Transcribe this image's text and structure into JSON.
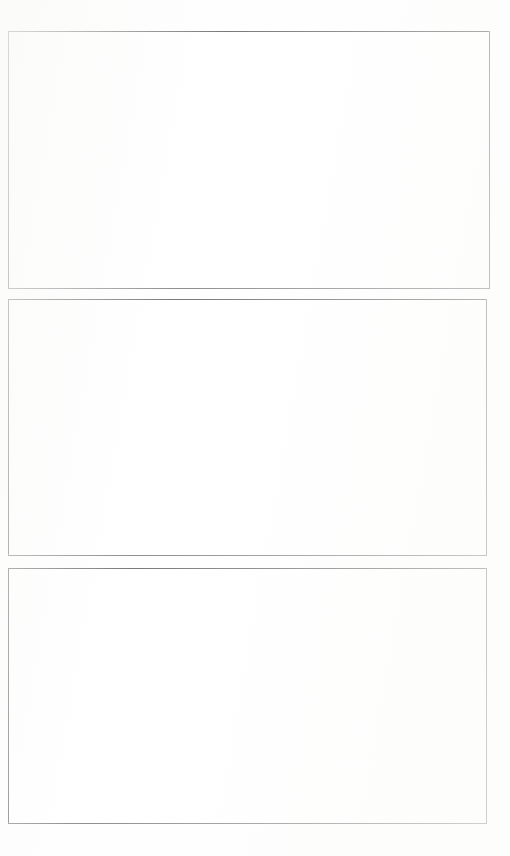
{
  "page": {
    "kind": "scanned-document-page",
    "width_px": 510,
    "height_px": 856,
    "background_color": "#fefefe",
    "content_text": "",
    "has_text": false,
    "has_caption": false,
    "frame_count": 3
  },
  "style": {
    "border_color": "#5e5e5e",
    "border_color_strong": "#3f3f3f",
    "frame_fill": "#ffffff",
    "border_width_px": 1
  },
  "frames": [
    {
      "id": "figure-frame-1",
      "label": "",
      "content": "",
      "state": "empty",
      "left_px": 8,
      "top_px": 31,
      "width_px": 482,
      "height_px": 258
    },
    {
      "id": "figure-frame-2",
      "label": "",
      "content": "",
      "state": "empty",
      "left_px": 8,
      "top_px": 299,
      "width_px": 479,
      "height_px": 257
    },
    {
      "id": "figure-frame-3",
      "label": "",
      "content": "",
      "state": "empty",
      "left_px": 8,
      "top_px": 568,
      "width_px": 479,
      "height_px": 256
    }
  ]
}
